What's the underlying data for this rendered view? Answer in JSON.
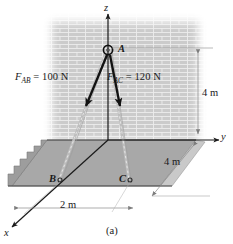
{
  "figure": {
    "caption": "(a)",
    "axes": {
      "z": "z",
      "y": "y",
      "x": "x"
    },
    "points": {
      "a": "A",
      "b": "B",
      "c": "C"
    },
    "forces": [
      {
        "id": "F_AB",
        "symbol": "F",
        "subscript": "AB",
        "equals": "=",
        "magnitude": "100",
        "unit": "N",
        "full_label": "F_AB = 100 N",
        "from": "A",
        "to": "B"
      },
      {
        "id": "F_AC",
        "symbol": "F",
        "subscript": "AC",
        "equals": "=",
        "magnitude": "120",
        "unit": "N",
        "full_label": "F_AC = 120 N",
        "from": "A",
        "to": "C"
      }
    ],
    "dimensions": [
      {
        "id": "height",
        "label": "4 m",
        "value": "4",
        "unit": "m",
        "orientation": "vertical"
      },
      {
        "id": "depth",
        "label": "4 m",
        "value": "4",
        "unit": "m",
        "orientation": "diagonal-y"
      },
      {
        "id": "width",
        "label": "2 m",
        "value": "2",
        "unit": "m",
        "orientation": "diagonal-x"
      }
    ],
    "colors": {
      "ink": "#1a1a1a",
      "ground_fill": "#a8a8a8",
      "ground_side": "#c4c4c4",
      "wall": "#cfcfcf",
      "wall_mortar": "#e8e8e8",
      "dim_line": "#8a8a8a",
      "rope": "#b5b5b5",
      "page": "#ffffff"
    }
  }
}
